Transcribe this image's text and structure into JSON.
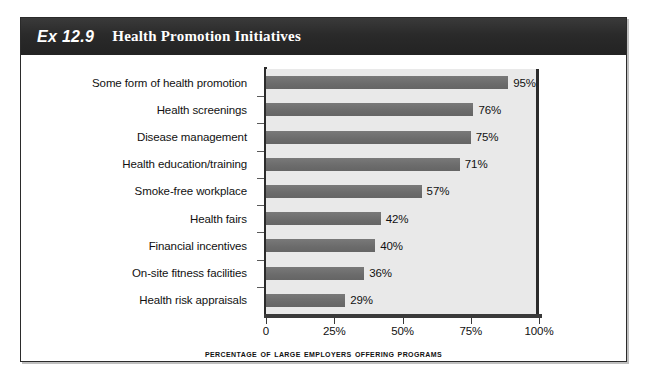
{
  "exhibit": {
    "number": "Ex 12.9",
    "title": "Health Promotion Initiatives"
  },
  "chart_data": {
    "type": "bar",
    "orientation": "horizontal",
    "title": "Health Promotion Initiatives",
    "xlabel": "Percentage of Large Employers Offering Programs",
    "ylabel": "",
    "xlim": [
      0,
      100
    ],
    "grid": false,
    "legend": null,
    "bar_color": "#6e6e6e",
    "plot_background": "#e9e9e9",
    "categories": [
      "Some form of health promotion",
      "Health screenings",
      "Disease management",
      "Health education/training",
      "Smoke-free workplace",
      "Health fairs",
      "Financial incentives",
      "On-site fitness facilities",
      "Health risk appraisals"
    ],
    "values": [
      95,
      76,
      75,
      71,
      57,
      42,
      40,
      36,
      29
    ],
    "value_labels": [
      "95%",
      "76%",
      "75%",
      "71%",
      "57%",
      "42%",
      "40%",
      "36%",
      "29%"
    ],
    "xticks": [
      0,
      25,
      50,
      75,
      100
    ],
    "xtick_labels": [
      "0",
      "25%",
      "50%",
      "75%",
      "100%"
    ]
  }
}
